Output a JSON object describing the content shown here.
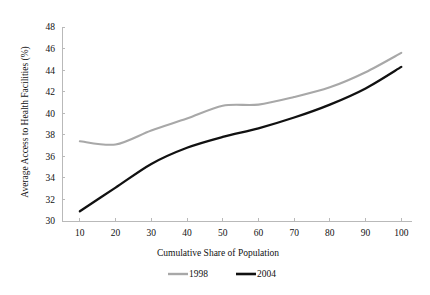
{
  "chart_data": {
    "type": "line",
    "title": "",
    "xlabel": "Cumulative Share of Population",
    "ylabel": "Average Access to Health Facilities (%)",
    "xlim": [
      5,
      103
    ],
    "ylim": [
      30,
      48
    ],
    "xticks": [
      10,
      20,
      30,
      40,
      50,
      60,
      70,
      80,
      90,
      100
    ],
    "yticks": [
      30,
      32,
      34,
      36,
      38,
      40,
      42,
      44,
      46,
      48
    ],
    "xtick_labels": [
      "10",
      "20",
      "30",
      "40",
      "50",
      "60",
      "70",
      "80",
      "90",
      "100"
    ],
    "ytick_labels": [
      "30",
      "32",
      "34",
      "36",
      "38",
      "40",
      "42",
      "44",
      "46",
      "48"
    ],
    "grid": false,
    "legend_position": "bottom",
    "x": [
      10,
      20,
      30,
      40,
      50,
      60,
      70,
      80,
      90,
      100
    ],
    "series": [
      {
        "name": "1998",
        "color": "#a8a8a8",
        "width": 2.1,
        "values": [
          37.4,
          37.1,
          38.4,
          39.5,
          40.7,
          40.8,
          41.5,
          42.4,
          43.8,
          45.6
        ]
      },
      {
        "name": "2004",
        "color": "#111111",
        "width": 2.3,
        "values": [
          30.9,
          33.1,
          35.3,
          36.8,
          37.8,
          38.6,
          39.6,
          40.8,
          42.3,
          44.3
        ]
      }
    ],
    "legend": [
      {
        "label": "1998",
        "color": "#a8a8a8",
        "width": 2.1
      },
      {
        "label": "2004",
        "color": "#111111",
        "width": 2.3
      }
    ]
  },
  "axis": {
    "color": "#b9b9b9"
  }
}
